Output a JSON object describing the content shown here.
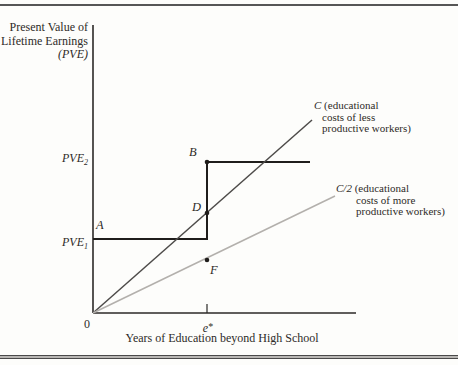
{
  "figure": {
    "background": "#fdfdfb",
    "ink": "#1f1d1b",
    "rule_color": "#4a4a4a",
    "y_axis_label": {
      "line1": "Present Value of",
      "line2": "Lifetime Earnings",
      "line3_open": "(",
      "line3_var": "PVE",
      "line3_close": ")"
    },
    "x_axis_label": "Years of Education beyond High School",
    "origin_label": "0",
    "x_tick_label": {
      "base": "e",
      "star": "*"
    },
    "y_tick_pve2": {
      "base": "PVE",
      "sub": "2"
    },
    "y_tick_pve1": {
      "base": "PVE",
      "sub": "1"
    },
    "point_labels": {
      "a": "A",
      "b": "B",
      "d": "D",
      "f": "F"
    },
    "curve_labels": {
      "c": {
        "var": "C",
        "rest": " (educational",
        "line2": "costs of less",
        "line3": "productive workers)"
      },
      "c2": {
        "var": "C/2",
        "rest": " (educational",
        "line2": "costs of more",
        "line3": "productive workers)"
      }
    }
  },
  "chart_data": {
    "type": "line",
    "title": "",
    "xlabel": "Years of Education beyond High School",
    "ylabel": "Present Value of Lifetime Earnings (PVE)",
    "x_ticks": [
      "0",
      "e*"
    ],
    "y_ticks": [
      "PVE1",
      "PVE2"
    ],
    "series": [
      {
        "name": "wage-schedule",
        "style": "step",
        "points_px": [
          [
            93,
            239
          ],
          [
            207,
            239
          ],
          [
            207,
            162
          ],
          [
            310,
            162
          ]
        ]
      },
      {
        "name": "cost-C",
        "style": "straight",
        "points_px": [
          [
            93,
            313
          ],
          [
            312,
            120
          ]
        ]
      },
      {
        "name": "cost-C-half",
        "style": "straight",
        "points_px": [
          [
            93,
            313
          ],
          [
            335,
            196
          ]
        ]
      }
    ],
    "lines": [
      {
        "name": "y-axis",
        "x1": 93,
        "y1": 25,
        "x2": 93,
        "y2": 313,
        "color": "#2b2927",
        "width": 1.6
      },
      {
        "name": "x-axis",
        "x1": 93,
        "y1": 313,
        "x2": 356,
        "y2": 313,
        "color": "#2b2927",
        "width": 1.6
      },
      {
        "name": "e-star-tick",
        "x1": 207,
        "y1": 304,
        "x2": 207,
        "y2": 313,
        "color": "#2b2927",
        "width": 1.2
      },
      {
        "name": "wage-low",
        "x1": 93,
        "y1": 239,
        "x2": 207,
        "y2": 239,
        "color": "#1f1d1b",
        "width": 2
      },
      {
        "name": "wage-jump",
        "x1": 207,
        "y1": 240,
        "x2": 207,
        "y2": 161,
        "color": "#1f1d1b",
        "width": 2
      },
      {
        "name": "wage-high",
        "x1": 207,
        "y1": 162,
        "x2": 310,
        "y2": 162,
        "color": "#1f1d1b",
        "width": 2
      },
      {
        "name": "cost-C",
        "x1": 93,
        "y1": 313,
        "x2": 312,
        "y2": 120,
        "color": "#4d4b49",
        "width": 1.5
      },
      {
        "name": "cost-C-half",
        "x1": 93,
        "y1": 313,
        "x2": 335,
        "y2": 196,
        "color": "#b3b0ac",
        "width": 1.5
      }
    ],
    "points": [
      {
        "name": "B",
        "x": 207,
        "y": 162
      },
      {
        "name": "D",
        "x": 207,
        "y": 213
      },
      {
        "name": "F",
        "x": 207,
        "y": 260
      }
    ]
  }
}
